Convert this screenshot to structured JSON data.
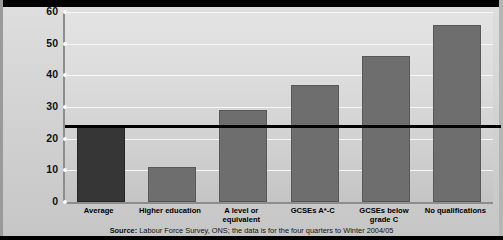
{
  "chart_data": {
    "type": "bar",
    "title": "",
    "xlabel": "",
    "ylabel": "Proportion of employed people aged 25 to 29 who earn less than £6.50 per hour gross (per cent)",
    "categories": [
      "Average",
      "Higher education",
      "A level or equivalent",
      "GCSEs A*-C",
      "GCSEs below grade C",
      "No qualifications"
    ],
    "values": [
      24,
      11,
      29,
      37,
      46,
      56
    ],
    "ylim": [
      0,
      60
    ],
    "yticks": [
      0,
      10,
      20,
      30,
      40,
      50,
      60
    ],
    "ytick_labels": [
      "0",
      "10",
      "20",
      "30",
      "40",
      "50",
      "60"
    ],
    "grid": true,
    "legend": "none",
    "annotations": [
      {
        "type": "reference-line",
        "label": "Average reference line",
        "value": 24
      }
    ],
    "bar_colors": [
      "#363636",
      "#6e6e6e",
      "#6e6e6e",
      "#6e6e6e",
      "#6e6e6e",
      "#6e6e6e"
    ],
    "highlight_category": "Average"
  },
  "source": {
    "prefix": "Source:",
    "text": " Labour Force Survey, ONS; the data is for the four quarters to Winter 2004/05"
  },
  "colors": {
    "bar_default": "#6e6e6e",
    "bar_highlight": "#363636",
    "reference_line": "#000000",
    "gridline": "#f7f7f7",
    "plot_background": "#d8d8d8",
    "axis": "#8d8d8d"
  }
}
